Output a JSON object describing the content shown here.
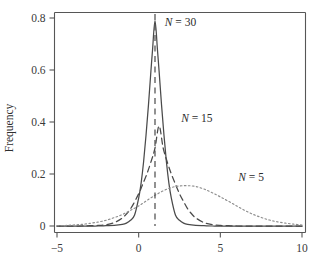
{
  "chart_data": {
    "type": "line",
    "title": "",
    "xlabel": "",
    "ylabel": "Frequency",
    "xlim": [
      -5,
      10
    ],
    "ylim": [
      0,
      0.85
    ],
    "grid": false,
    "legend_position": "inline-annotations",
    "xticks": [
      -5,
      0,
      5,
      10
    ],
    "xtick_labels": [
      "−5",
      "0",
      "5",
      "10"
    ],
    "yticks": [
      0,
      0.2,
      0.4,
      0.6,
      0.8
    ],
    "ytick_labels": [
      "0",
      "0.2",
      "0.4",
      "0.6",
      "0.8"
    ],
    "annotations": [
      {
        "text": "N = 30",
        "x": 1.6,
        "y": 0.77
      },
      {
        "text": "N = 15",
        "x": 2.6,
        "y": 0.4
      },
      {
        "text": "N = 5",
        "x": 6.1,
        "y": 0.175
      }
    ],
    "reference_lines": [
      {
        "orientation": "vertical",
        "x": 1.0,
        "style": "dashed",
        "label": ""
      }
    ],
    "series": [
      {
        "name": "N = 30",
        "style": "solid",
        "color": "#4a4a4a",
        "mean": 1.0,
        "peak_value": 0.79,
        "sigma": 0.5,
        "x": [
          -5,
          -4.5,
          -4,
          -3.5,
          -3,
          -2.5,
          -2,
          -1.5,
          -1,
          -0.75,
          -0.5,
          -0.25,
          0,
          0.15,
          0.3,
          0.45,
          0.6,
          0.75,
          0.85,
          1,
          1.15,
          1.25,
          1.4,
          1.55,
          1.7,
          1.85,
          2,
          2.25,
          2.5,
          2.75,
          3,
          3.5,
          4,
          4.5,
          5,
          6,
          7,
          8,
          9,
          10
        ],
        "y": [
          0,
          0,
          0,
          0,
          0,
          0,
          0.001,
          0.002,
          0.006,
          0.011,
          0.022,
          0.042,
          0.107,
          0.165,
          0.246,
          0.349,
          0.466,
          0.596,
          0.678,
          0.79,
          0.678,
          0.596,
          0.466,
          0.349,
          0.246,
          0.165,
          0.107,
          0.042,
          0.022,
          0.011,
          0.006,
          0.002,
          0.001,
          0,
          0,
          0,
          0,
          0,
          0,
          0
        ]
      },
      {
        "name": "N = 15",
        "style": "dashed",
        "color": "#4a4a4a",
        "mean": 1.25,
        "peak_value": 0.385,
        "sigma": 1.03,
        "x": [
          -5,
          -4.5,
          -4,
          -3.5,
          -3,
          -2.5,
          -2,
          -1.5,
          -1,
          -0.5,
          0,
          0.25,
          0.5,
          0.75,
          1,
          1.25,
          1.5,
          1.75,
          2,
          2.25,
          2.5,
          2.75,
          3,
          3.25,
          3.5,
          4,
          4.5,
          5,
          5.5,
          6,
          7,
          8,
          9,
          10
        ],
        "y": [
          0,
          0,
          0,
          0,
          0.001,
          0.002,
          0.005,
          0.013,
          0.031,
          0.066,
          0.124,
          0.161,
          0.2,
          0.246,
          0.3,
          0.385,
          0.3,
          0.246,
          0.2,
          0.161,
          0.124,
          0.094,
          0.066,
          0.046,
          0.031,
          0.013,
          0.005,
          0.002,
          0.001,
          0,
          0,
          0,
          0,
          0
        ]
      },
      {
        "name": "N = 5",
        "style": "dotted",
        "color": "#8d8d8d",
        "mean": 3.0,
        "peak_value": 0.155,
        "sigma": 2.6,
        "x": [
          -5,
          -4.5,
          -4,
          -3.5,
          -3,
          -2.5,
          -2,
          -1.5,
          -1,
          -0.5,
          0,
          0.5,
          1,
          1.5,
          2,
          2.5,
          3,
          3.5,
          4,
          4.5,
          5,
          5.5,
          6,
          6.5,
          7,
          7.5,
          8,
          8.5,
          9,
          9.5,
          10
        ],
        "y": [
          0.001,
          0.002,
          0.004,
          0.006,
          0.01,
          0.015,
          0.022,
          0.032,
          0.044,
          0.06,
          0.077,
          0.098,
          0.118,
          0.135,
          0.148,
          0.154,
          0.155,
          0.152,
          0.142,
          0.128,
          0.112,
          0.095,
          0.077,
          0.06,
          0.045,
          0.033,
          0.023,
          0.016,
          0.011,
          0.007,
          0.004
        ]
      }
    ]
  },
  "axes": {
    "ylabel": "Frequency"
  }
}
